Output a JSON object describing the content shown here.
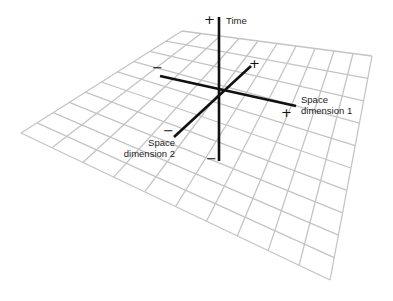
{
  "diagram": {
    "grid": {
      "corners": {
        "top": [
          182,
          31
        ],
        "right": [
          372,
          56
        ],
        "bottom": [
          330,
          280
        ],
        "left": [
          21,
          133
        ]
      },
      "cells_u": 10,
      "cells_v": 10,
      "line_color": "#c4c4c4"
    },
    "axes": {
      "color": "#111111",
      "time": {
        "label": "Time",
        "from": [
          219,
          161
        ],
        "to": [
          219,
          17
        ],
        "plus": "+",
        "minus": "−"
      },
      "space1": {
        "label_line1": "Space",
        "label_line2": "dimension 1",
        "from": [
          160,
          76
        ],
        "to": [
          296,
          106
        ],
        "plus": "+",
        "minus": "−"
      },
      "space2": {
        "label_line1": "Space",
        "label_line2": "dimension 2",
        "from": [
          174,
          137
        ],
        "to": [
          251,
          66
        ],
        "plus": "+",
        "minus": "−"
      }
    }
  }
}
